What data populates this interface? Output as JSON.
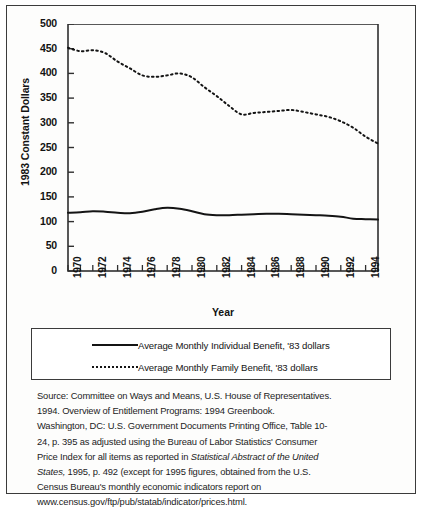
{
  "chart_data": {
    "type": "line",
    "title": "",
    "xlabel": "Year",
    "ylabel": "1983 Constant Dollars",
    "xlim": [
      1970,
      1995
    ],
    "ylim": [
      0,
      500
    ],
    "yticks": [
      0,
      50,
      100,
      150,
      200,
      250,
      300,
      350,
      400,
      450,
      500
    ],
    "xticks": [
      1970,
      1972,
      1974,
      1976,
      1978,
      1980,
      1982,
      1984,
      1986,
      1988,
      1990,
      1992,
      1994
    ],
    "x": [
      1970,
      1971,
      1972,
      1973,
      1974,
      1975,
      1976,
      1977,
      1978,
      1979,
      1980,
      1981,
      1982,
      1983,
      1984,
      1985,
      1986,
      1987,
      1988,
      1989,
      1990,
      1991,
      1992,
      1993,
      1994,
      1995
    ],
    "grid": false,
    "legend_position": "below-plot",
    "series": [
      {
        "name": "Average Monthly Individual Benefit, '83 dollars",
        "style": "solid",
        "values": [
          118,
          119,
          121,
          120,
          118,
          117,
          120,
          125,
          128,
          126,
          121,
          115,
          113,
          113,
          114,
          115,
          116,
          116,
          115,
          114,
          113,
          112,
          110,
          106,
          105,
          104
        ]
      },
      {
        "name": "Average Monthly Family Benefit, '83 dollars",
        "style": "dotted",
        "values": [
          452,
          445,
          447,
          441,
          424,
          410,
          396,
          393,
          396,
          400,
          392,
          372,
          354,
          334,
          317,
          320,
          322,
          324,
          326,
          322,
          317,
          312,
          303,
          290,
          272,
          258
        ]
      }
    ]
  },
  "legend": {
    "items": [
      {
        "label": "Average Monthly Individual Benefit, '83 dollars",
        "style": "solid"
      },
      {
        "label": "Average Monthly Family Benefit, '83 dollars",
        "style": "dotted"
      }
    ]
  },
  "source_note": {
    "lines": [
      "Source:  Committee on Ways and Means, U.S. House of Representatives.",
      "1994.  Overview of Entitlement Programs:  1994 Greenbook.",
      "Washington, DC:  U.S. Government Documents Printing Office, Table 10-",
      "24, p. 395 as adjusted using the Bureau of Labor Statistics' Consumer"
    ],
    "line5_pre": "Price Index for all items as reported in ",
    "line5_italic": "Statistical Abstract of the United",
    "line6_italic": "States,",
    "line6_post": " 1995, p. 492 (except for 1995 figures, obtained from the U.S.",
    "line7": "Census Bureau's monthly economic indicators report on",
    "line8": "www.census.gov/ftp/pub/statab/indicator/prices.html."
  },
  "colors": {
    "ink": "#141414",
    "frame": "#3b3b3b",
    "background": "#fdfdfc"
  }
}
